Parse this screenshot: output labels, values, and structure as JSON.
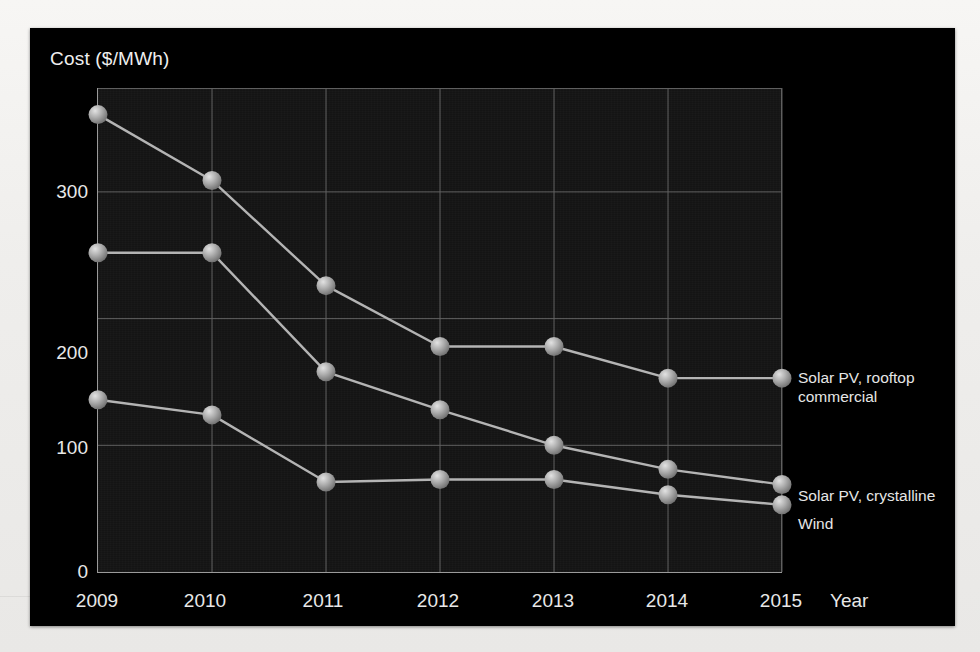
{
  "slide": {
    "background_color": "#000000",
    "page_background_color": "#f2f1ef"
  },
  "chart_data": {
    "type": "line",
    "title": "Cost ($/MWh)",
    "xlabel": "Year",
    "ylabel": "Cost ($/MWh)",
    "categories": [
      "2009",
      "2010",
      "2011",
      "2012",
      "2013",
      "2014",
      "2015"
    ],
    "xtick_labels": [
      "2009",
      "2010",
      "2011",
      "2012",
      "2013",
      "2014",
      "2015"
    ],
    "ytick_labels": [
      "0",
      "100",
      "200",
      "300"
    ],
    "ylim": [
      0,
      382
    ],
    "yticks": [
      0,
      100,
      200,
      300
    ],
    "grid": true,
    "legend_position": "right-inline",
    "marker": "sphere",
    "series": [
      {
        "name": "Solar PV, rooftop commercial",
        "label_lines": [
          "Solar PV, rooftop",
          "commercial"
        ],
        "color": "#b4b4b4",
        "values": [
          361,
          309,
          226,
          178,
          178,
          153,
          153
        ]
      },
      {
        "name": "Solar PV, crystalline",
        "label_lines": [
          "Solar PV, crystalline"
        ],
        "color": "#b4b4b4",
        "values": [
          252,
          252,
          158,
          128,
          100,
          81,
          69
        ]
      },
      {
        "name": "Wind",
        "label_lines": [
          "Wind"
        ],
        "color": "#b4b4b4",
        "values": [
          136,
          124,
          71,
          73,
          73,
          61,
          53
        ]
      }
    ]
  }
}
